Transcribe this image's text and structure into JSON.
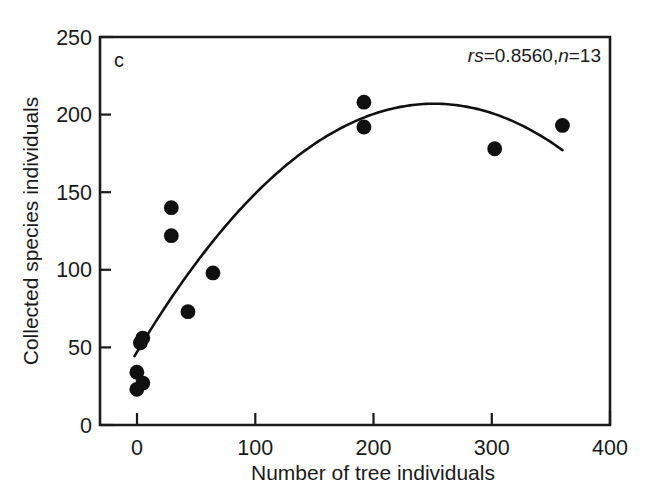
{
  "chart_data": {
    "type": "scatter",
    "title": "",
    "panel_label": "c",
    "xlabel": "Number of tree individuals",
    "ylabel": "Collected species individuals",
    "xlim": [
      -29,
      400
    ],
    "ylim": [
      0,
      250
    ],
    "xticks": [
      0,
      100,
      200,
      300,
      400
    ],
    "yticks": [
      0,
      50,
      100,
      150,
      200,
      250
    ],
    "grid": false,
    "legend": "none",
    "marker": "filled-circle",
    "marker_color": "#101010",
    "points": [
      {
        "x": 2,
        "y": 34
      },
      {
        "x": 2,
        "y": 23
      },
      {
        "x": 7,
        "y": 27
      },
      {
        "x": 5,
        "y": 53
      },
      {
        "x": 7,
        "y": 56
      },
      {
        "x": 31,
        "y": 140
      },
      {
        "x": 31,
        "y": 122
      },
      {
        "x": 45,
        "y": 73
      },
      {
        "x": 66,
        "y": 98
      },
      {
        "x": 193,
        "y": 208
      },
      {
        "x": 193,
        "y": 192
      },
      {
        "x": 303,
        "y": 178
      },
      {
        "x": 360,
        "y": 193
      }
    ],
    "fit": {
      "type": "quadratic",
      "description": "fitted curve, peak near x=250",
      "color": "#111111",
      "x_start": 0,
      "x_end": 360,
      "vertex_x": 252,
      "vertex_y": 207,
      "y_start": 45,
      "y_end": 177
    },
    "annotations": [
      {
        "name": "correlation-annotation",
        "text": "rs=0.8560,n=13",
        "rs_label": "r",
        "s_label": "s",
        "rs_value": "=0.8560,",
        "n_label": "n",
        "n_value": "=13"
      }
    ],
    "statistics": {
      "rs": 0.856,
      "n": 13
    }
  },
  "axes": {
    "x_tick_labels": [
      "0",
      "100",
      "200",
      "300",
      "400"
    ],
    "y_tick_labels": [
      "0",
      "50",
      "100",
      "150",
      "200",
      "250"
    ],
    "x_title": "Number of tree individuals",
    "y_title": "Collected species individuals"
  },
  "panel": {
    "label": "c"
  },
  "annotation": {
    "rs_italic": "r",
    "s_italic": "s",
    "rs_value": "=0.8560,",
    "n_italic": "n",
    "n_value": "=13"
  }
}
